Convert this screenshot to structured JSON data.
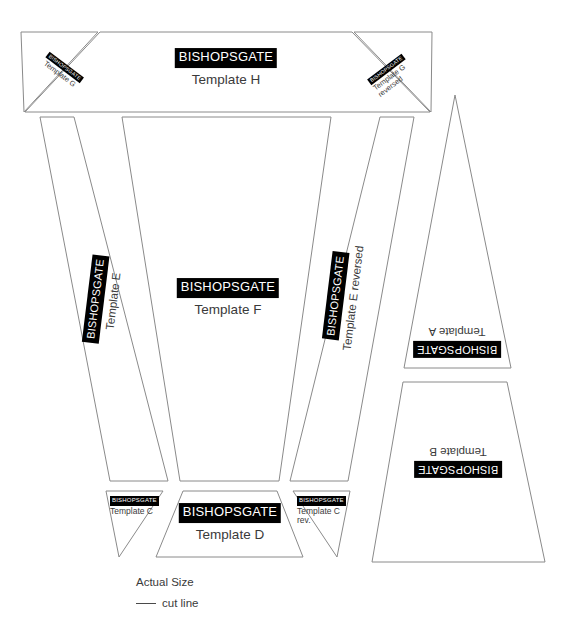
{
  "document": {
    "title": "BISHOPSGATE templates cutting sheet",
    "brand": "BISHOPSGATE",
    "line_color": "#8a8a8a",
    "badge_bg": "#000000",
    "badge_fg": "#ffffff",
    "label_color": "#3a3a3a",
    "background": "#ffffff"
  },
  "templates": [
    {
      "id": "H",
      "brand": "BISHOPSGATE",
      "name": "Template H",
      "shape": "trapezoid",
      "rotation": 0,
      "points": "100,32 352,32 430,112 25,112"
    },
    {
      "id": "G",
      "brand": "BISHOPSGATE",
      "name": "Template G",
      "shape": "triangle",
      "rotation": 37,
      "points": "21,32 98,32 24,112"
    },
    {
      "id": "G-reversed",
      "brand": "BISHOPSGATE",
      "name": "Template G reversed",
      "shape": "triangle",
      "rotation": -37,
      "points": "354,32 432,32 431,112"
    },
    {
      "id": "E",
      "brand": "BISHOPSGATE",
      "name": "Template E",
      "shape": "quadrilateral",
      "rotation": -83,
      "points": "40,117 74,117 168,481 110,481"
    },
    {
      "id": "F",
      "brand": "BISHOPSGATE",
      "name": "Template F",
      "shape": "trapezoid",
      "rotation": 0,
      "points": "122,117 331,117 279,481 180,481"
    },
    {
      "id": "E-reversed",
      "brand": "BISHOPSGATE",
      "name": "Template E reversed",
      "shape": "quadrilateral",
      "rotation": -83,
      "points": "380,117 414,117 348,481 290,481"
    },
    {
      "id": "A",
      "brand": "BISHOPSGATE",
      "name": "Template A",
      "shape": "triangle",
      "rotation": 180,
      "points": "455,95 511,368 404,368"
    },
    {
      "id": "B",
      "brand": "BISHOPSGATE",
      "name": "Template B",
      "shape": "trapezoid",
      "rotation": 180,
      "points": "403,382 507,382 545,562 372,562"
    },
    {
      "id": "C",
      "brand": "BISHOPSGATE",
      "name": "Template C",
      "shape": "triangle",
      "rotation": 0,
      "points": "106,491 163,491 119,557"
    },
    {
      "id": "D",
      "brand": "BISHOPSGATE",
      "name": "Template D",
      "shape": "trapezoid",
      "rotation": 0,
      "points": "183,491 277,491 303,557 156,557"
    },
    {
      "id": "C-reversed",
      "brand": "BISHOPSGATE",
      "name": "Template C rev.",
      "shape": "triangle",
      "rotation": 0,
      "points": "293,491 350,491 337,557"
    }
  ],
  "legend": {
    "actual_size": "Actual Size",
    "cut_line": "cut line"
  }
}
